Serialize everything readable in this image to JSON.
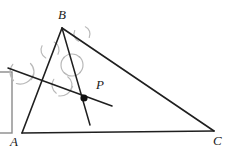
{
  "figure": {
    "type": "geometry-construction",
    "canvas": {
      "width": 229,
      "height": 152,
      "background": "#ffffff"
    },
    "colors": {
      "stroke": "#1f1f1f",
      "arc": "#b9b9b9",
      "point_fill": "#111111",
      "label": "#1a1a1a",
      "frame": "#8a8a8a"
    },
    "labels": {
      "A": "A",
      "B": "B",
      "C": "C",
      "P": "P"
    },
    "label_positions": {
      "A": {
        "x": 10,
        "y": 135
      },
      "B": {
        "x": 58,
        "y": 8
      },
      "C": {
        "x": 213,
        "y": 134
      },
      "P": {
        "x": 96,
        "y": 78
      }
    },
    "points": {
      "A": {
        "x": 22,
        "y": 133
      },
      "B": {
        "x": 62,
        "y": 28
      },
      "C": {
        "x": 214,
        "y": 131
      },
      "P": {
        "x": 84,
        "y": 98
      }
    },
    "triangle": {
      "name": "triangle-abc",
      "vertices": "22,133 62,28 214,131",
      "sides": [
        {
          "name": "side-ab",
          "x1": 22,
          "y1": 133,
          "x2": 62,
          "y2": 28
        },
        {
          "name": "side-bc",
          "x1": 62,
          "y1": 28,
          "x2": 214,
          "y2": 131
        },
        {
          "name": "side-ca",
          "x1": 214,
          "y1": 131,
          "x2": 22,
          "y2": 133
        }
      ]
    },
    "construction_lines": [
      {
        "name": "cevian-from-b",
        "description": "line from vertex B through point P extended past P",
        "x1": 62,
        "y1": 28,
        "x2": 90,
        "y2": 125
      },
      {
        "name": "transversal-through-p",
        "description": "angle bisector / perpendicular line crossing through P",
        "x1": 8,
        "y1": 68,
        "x2": 112,
        "y2": 106
      }
    ],
    "point_marker": {
      "name": "point-p-marker",
      "cx": 84,
      "cy": 98,
      "r": 3.6
    },
    "arcs": [
      {
        "name": "arc-mark-ab-upper",
        "cx": 50,
        "cy": 50,
        "r": 9,
        "a1": -62,
        "a2": 28,
        "rot": 0
      },
      {
        "name": "arc-mark-ab-upper-2",
        "cx": 50,
        "cy": 50,
        "r": 9,
        "a1": 118,
        "a2": 208,
        "rot": 0
      },
      {
        "name": "arc-mark-bc-upper",
        "cx": 82,
        "cy": 34,
        "r": 8,
        "a1": -65,
        "a2": 25,
        "rot": 0
      },
      {
        "name": "arc-mark-bc-upper-2",
        "cx": 82,
        "cy": 34,
        "r": 8,
        "a1": 115,
        "a2": 205,
        "rot": 0
      },
      {
        "name": "arc-cross-mid-1",
        "cx": 72,
        "cy": 65,
        "r": 11,
        "a1": -50,
        "a2": 45,
        "rot": 0
      },
      {
        "name": "arc-cross-mid-2",
        "cx": 72,
        "cy": 65,
        "r": 11,
        "a1": 130,
        "a2": 225,
        "rot": 0
      },
      {
        "name": "arc-cross-mid-3",
        "cx": 72,
        "cy": 65,
        "r": 11,
        "a1": 40,
        "a2": 135,
        "rot": 0
      },
      {
        "name": "arc-cross-mid-4",
        "cx": 72,
        "cy": 65,
        "r": 11,
        "a1": 220,
        "a2": 315,
        "rot": 0
      },
      {
        "name": "arc-left-upper-1",
        "cx": 22,
        "cy": 72,
        "r": 12,
        "a1": -45,
        "a2": 40,
        "rot": 0
      },
      {
        "name": "arc-left-upper-2",
        "cx": 22,
        "cy": 72,
        "r": 12,
        "a1": 135,
        "a2": 220,
        "rot": 0
      },
      {
        "name": "arc-left-upper-3",
        "cx": 20,
        "cy": 70,
        "r": 14,
        "a1": 20,
        "a2": 105,
        "rot": 0
      },
      {
        "name": "arc-lower-mid-1",
        "cx": 62,
        "cy": 85,
        "r": 10,
        "a1": -55,
        "a2": 35,
        "rot": 0
      },
      {
        "name": "arc-lower-mid-2",
        "cx": 62,
        "cy": 85,
        "r": 10,
        "a1": 125,
        "a2": 215,
        "rot": 0
      },
      {
        "name": "arc-lower-mid-3",
        "cx": 60,
        "cy": 83,
        "r": 13,
        "a1": 15,
        "a2": 95,
        "rot": 0
      }
    ],
    "partial_frame": {
      "name": "cropped-frame-left-edge",
      "description": "partially visible rectangular border at the left image edge",
      "x": -6,
      "y": 72,
      "width": 18,
      "height": 61
    }
  }
}
